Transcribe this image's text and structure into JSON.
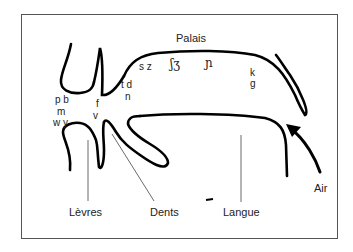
{
  "diagram": {
    "regions": {
      "palais": "Palais",
      "levres": "Lèvres",
      "dents": "Dents",
      "langue": "Langue",
      "air": "Air"
    },
    "phonemes": {
      "bilabial_1": "p b",
      "bilabial_2": "m",
      "bilabial_3": "w y",
      "labiodental_1": "f",
      "labiodental_2": "v",
      "alveolar_1": "t d",
      "alveolar_2": "n",
      "alveolar_fric": "s z",
      "postalveolar": "ʃʒ",
      "palatal": "ɲ",
      "velar_1": "k",
      "velar_2": "g"
    },
    "colors": {
      "stroke": "#000000",
      "frame": "#555555",
      "leader": "#444444"
    }
  }
}
